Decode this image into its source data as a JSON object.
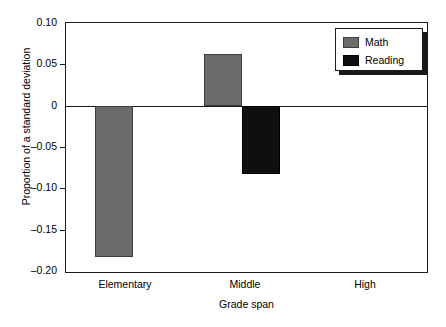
{
  "chart_data": {
    "type": "bar",
    "title": "",
    "xlabel": "Grade span",
    "ylabel": "Proportion of a standard deviation",
    "categories": [
      "Elementary",
      "Middle",
      "High"
    ],
    "series": [
      {
        "name": "Math",
        "color": "#6b6b6b",
        "values": [
          -0.183,
          0.062,
          0.0
        ]
      },
      {
        "name": "Reading",
        "color": "#100f0f",
        "values": [
          0.0,
          -0.083,
          0.0
        ]
      }
    ],
    "ylim": [
      -0.2,
      0.1
    ],
    "ytick_values": [
      0.1,
      0.05,
      0,
      -0.05,
      -0.1,
      -0.15,
      -0.2
    ],
    "ytick_labels": [
      "0.10",
      "0.05",
      "0",
      "–0.05",
      "–0.10",
      "–0.15",
      "–0.20"
    ],
    "grid": false,
    "zero_line": true,
    "legend": {
      "position": "top-right",
      "entries": [
        "Math",
        "Reading"
      ]
    }
  }
}
